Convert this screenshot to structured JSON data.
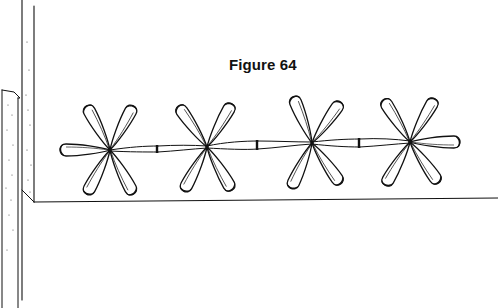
{
  "figure": {
    "caption": "Figure 64",
    "ink_color": "#111111",
    "background_color": "#ffffff"
  },
  "flowers": [
    {
      "id": 1,
      "cx": 110,
      "cy": 150
    },
    {
      "id": 2,
      "cx": 207,
      "cy": 147
    },
    {
      "id": 3,
      "cx": 312,
      "cy": 143
    },
    {
      "id": 4,
      "cx": 410,
      "cy": 142
    }
  ],
  "joints": [
    {
      "x": 158,
      "y": 149
    },
    {
      "x": 258,
      "y": 145
    },
    {
      "x": 360,
      "y": 143
    }
  ]
}
